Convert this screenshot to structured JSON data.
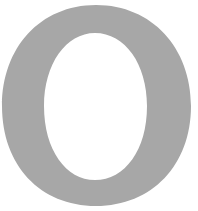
{
  "glyph": {
    "character": "O",
    "fill_color": "#a7a7a7",
    "background_color": "#ffffff"
  }
}
